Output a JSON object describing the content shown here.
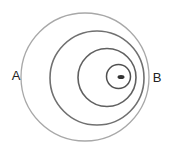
{
  "diagram": {
    "type": "concentric-wavefronts",
    "labels": {
      "left": {
        "text": "A",
        "x": 16,
        "y": 80
      },
      "right": {
        "text": "B",
        "x": 157,
        "y": 82
      }
    },
    "wavefronts": [
      {
        "cx": 85,
        "cy": 77,
        "r": 64,
        "stroke": "#a8a8a8",
        "width": 1.3
      },
      {
        "cx": 97,
        "cy": 78,
        "r": 47,
        "stroke": "#707070",
        "width": 1.6
      },
      {
        "cx": 107,
        "cy": 77.5,
        "r": 29,
        "stroke": "#606060",
        "width": 1.6
      },
      {
        "cx": 118.5,
        "cy": 76.5,
        "r": 12,
        "stroke": "#505050",
        "width": 1.5
      }
    ],
    "source": {
      "cx": 121,
      "cy": 77,
      "rx": 3.5,
      "ry": 2,
      "fill": "#333333"
    }
  }
}
